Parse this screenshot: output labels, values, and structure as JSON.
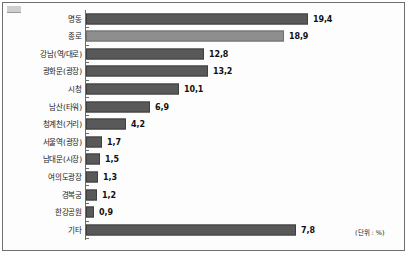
{
  "chart_data": {
    "type": "bar",
    "orientation": "horizontal",
    "title": "",
    "subtitle": "",
    "xlabel": "",
    "ylabel": "",
    "unit_note": "(단위 : %)",
    "grid": false,
    "legend": null,
    "xlim": [
      0,
      20
    ],
    "categories": [
      "명동",
      "종로",
      "강남(역/대로)",
      "광화문(광장)",
      "시청",
      "남산(타워)",
      "청계천(거리)",
      "서울역(광장)",
      "남대문(시장)",
      "여의도광장",
      "경복궁",
      "한강공원",
      "기타"
    ],
    "values": [
      19.4,
      18.9,
      12.8,
      13.2,
      10.1,
      6.9,
      4.2,
      1.7,
      1.5,
      1.3,
      1.2,
      0.9,
      7.8
    ],
    "value_labels": [
      "19,4",
      "18,9",
      "12,8",
      "13,2",
      "10,1",
      "6,9",
      "4,2",
      "1,7",
      "1,5",
      "1,3",
      "1,2",
      "0,9",
      "7,8"
    ],
    "bar_pixel_widths": [
      222,
      198,
      118,
      122,
      93,
      64,
      40,
      16,
      14,
      12,
      11,
      8,
      210
    ],
    "bar_shades": [
      "dark",
      "light",
      "dark",
      "dark",
      "dark",
      "dark",
      "dark",
      "dark",
      "dark",
      "dark",
      "dark",
      "dark",
      "dark"
    ],
    "colors": {
      "bar_dark": "#595959",
      "bar_light": "#8e8e8e",
      "bar_border": "#3f3f3f",
      "axis": "#6b6b6b",
      "frame": "#6f6f6f",
      "text": "#1a1a1a",
      "background": "#fdfdfd"
    }
  }
}
